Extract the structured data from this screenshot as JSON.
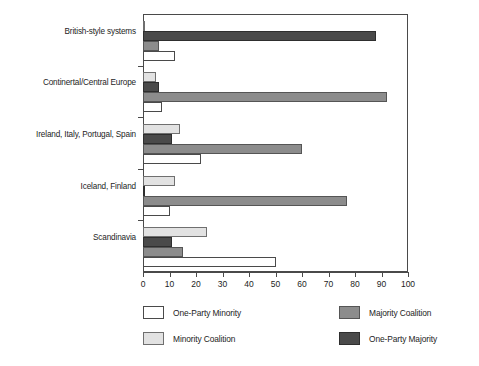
{
  "chart_data": {
    "type": "bar",
    "orientation": "horizontal",
    "title": "",
    "subtitle": "",
    "xlabel": "",
    "ylabel": "",
    "xlim": [
      0,
      100
    ],
    "xticks": [
      0,
      10,
      20,
      30,
      40,
      50,
      60,
      70,
      80,
      90,
      100
    ],
    "xtick_labels": [
      "0",
      "10",
      "20",
      "30",
      "40",
      "50",
      "60",
      "70",
      "80",
      "90",
      "100"
    ],
    "grid": false,
    "legend_position": "bottom",
    "categories": [
      "British-style systems",
      "Continertal/Central Europe",
      "Ireland, Italy, Portugal, Spain",
      "Iceland, Finland",
      "Scandinavia"
    ],
    "series": [
      {
        "name": "One-Party Minority",
        "key": "one-party-minority",
        "color": "#ffffff",
        "values": [
          12,
          7,
          22,
          10,
          50
        ]
      },
      {
        "name": "Minority Coalition",
        "key": "minority-coalition",
        "color": "#e2e2e2",
        "values": [
          0.5,
          5,
          14,
          12,
          24
        ]
      },
      {
        "name": "Majority Coalition",
        "key": "majority-coalition",
        "color": "#8c8c8c",
        "values": [
          6,
          92,
          60,
          77,
          15
        ]
      },
      {
        "name": "One-Party Majority",
        "key": "one-party-majority",
        "color": "#4a4a4a",
        "values": [
          88,
          6,
          11,
          0.5,
          11
        ]
      }
    ],
    "series_draw_order": [
      "minority-coalition",
      "one-party-majority",
      "majority-coalition",
      "one-party-minority"
    ]
  },
  "legend": {
    "items": [
      {
        "label": "One-Party Minority",
        "key": "one-party-minority"
      },
      {
        "label": "Minority Coalition",
        "key": "minority-coalition"
      },
      {
        "label": "Majority Coalition",
        "key": "majority-coalition"
      },
      {
        "label": "One-Party Majority",
        "key": "one-party-majority"
      }
    ]
  },
  "colors": {
    "one_party_minority": "#ffffff",
    "minority_coalition": "#e2e2e2",
    "majority_coalition": "#8c8c8c",
    "one_party_majority": "#4a4a4a",
    "axis": "#4a4a4a",
    "text": "#1d1d1d",
    "background": "#ffffff"
  }
}
